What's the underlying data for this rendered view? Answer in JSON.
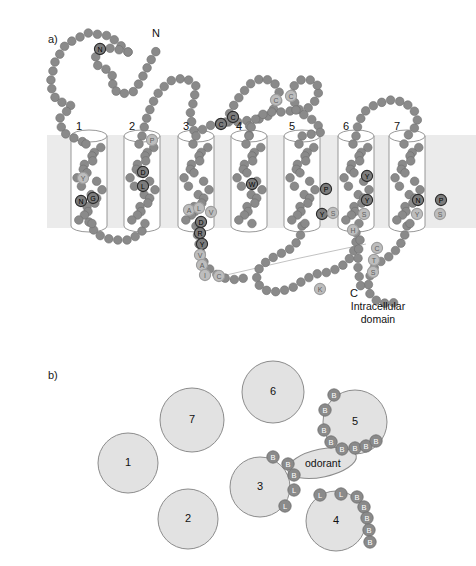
{
  "figure": {
    "type": "scientific-diagram",
    "panels": [
      {
        "id": "a",
        "label": "a)",
        "x": 48,
        "y": 33
      },
      {
        "id": "b",
        "label": "b)",
        "x": 48,
        "y": 369
      }
    ]
  },
  "panel_a": {
    "n_terminus_label": "N",
    "c_terminus_label": "C",
    "intracellular_caption_line1": "Intracellular",
    "intracellular_caption_line2": "domain",
    "membrane": {
      "top": 135,
      "bottom": 228,
      "color": "#ebebeb"
    },
    "helices": [
      {
        "num": "1",
        "label_x": 76,
        "label_y": 120,
        "cx": 89,
        "top": 136,
        "bottom": 226,
        "rx": 18
      },
      {
        "num": "2",
        "label_x": 129,
        "label_y": 120,
        "cx": 142,
        "top": 136,
        "bottom": 226,
        "rx": 18
      },
      {
        "num": "3",
        "label_x": 183,
        "label_y": 120,
        "cx": 196,
        "top": 136,
        "bottom": 226,
        "rx": 18
      },
      {
        "num": "4",
        "label_x": 236,
        "label_y": 120,
        "cx": 249,
        "top": 136,
        "bottom": 226,
        "rx": 18
      },
      {
        "num": "5",
        "label_x": 289,
        "label_y": 120,
        "cx": 302,
        "top": 136,
        "bottom": 226,
        "rx": 18
      },
      {
        "num": "6",
        "label_x": 343,
        "label_y": 120,
        "cx": 356,
        "top": 136,
        "bottom": 226,
        "rx": 18
      },
      {
        "num": "7",
        "label_x": 394,
        "label_y": 120,
        "cx": 407,
        "top": 136,
        "bottom": 226,
        "rx": 18
      }
    ],
    "residue_colors": {
      "dark_bead": "#8a8a8a",
      "bead_stroke": "#6e6e6e",
      "highlight_dark": "#7c7c7c",
      "highlight_light": "#bdbdbd",
      "label_dark": "#111111",
      "label_light": "#777777"
    },
    "labeled_residues": [
      {
        "letter": "N",
        "x": 100,
        "y": 49,
        "tone": "dark",
        "note": "glycosylation-site"
      },
      {
        "letter": "Y",
        "x": 83,
        "y": 178,
        "tone": "light"
      },
      {
        "letter": "N",
        "x": 81,
        "y": 201,
        "tone": "dark"
      },
      {
        "letter": "G",
        "x": 93,
        "y": 198,
        "tone": "dark"
      },
      {
        "letter": "P",
        "x": 152,
        "y": 140,
        "tone": "light"
      },
      {
        "letter": "D",
        "x": 143,
        "y": 172,
        "tone": "dark"
      },
      {
        "letter": "L",
        "x": 143,
        "y": 186,
        "tone": "dark"
      },
      {
        "letter": "C",
        "x": 221,
        "y": 124,
        "tone": "dark",
        "note": "disulfide"
      },
      {
        "letter": "C",
        "x": 233,
        "y": 117,
        "tone": "dark",
        "note": "disulfide"
      },
      {
        "letter": "C",
        "x": 276,
        "y": 100,
        "tone": "light"
      },
      {
        "letter": "C",
        "x": 291,
        "y": 96,
        "tone": "light"
      },
      {
        "letter": "A",
        "x": 189,
        "y": 210,
        "tone": "light"
      },
      {
        "letter": "L",
        "x": 199,
        "y": 208,
        "tone": "light"
      },
      {
        "letter": "V",
        "x": 211,
        "y": 212,
        "tone": "light"
      },
      {
        "letter": "D",
        "x": 201,
        "y": 222,
        "tone": "dark"
      },
      {
        "letter": "R",
        "x": 200,
        "y": 233,
        "tone": "dark"
      },
      {
        "letter": "Y",
        "x": 202,
        "y": 244,
        "tone": "dark"
      },
      {
        "letter": "V",
        "x": 200,
        "y": 255,
        "tone": "light"
      },
      {
        "letter": "A",
        "x": 202,
        "y": 265,
        "tone": "light"
      },
      {
        "letter": "I",
        "x": 205,
        "y": 275,
        "tone": "light"
      },
      {
        "letter": "C",
        "x": 219,
        "y": 276,
        "tone": "light"
      },
      {
        "letter": "W",
        "x": 252,
        "y": 184,
        "tone": "dark"
      },
      {
        "letter": "P",
        "x": 326,
        "y": 189,
        "tone": "dark"
      },
      {
        "letter": "Y",
        "x": 322,
        "y": 214,
        "tone": "dark"
      },
      {
        "letter": "S",
        "x": 333,
        "y": 213,
        "tone": "light"
      },
      {
        "letter": "Y",
        "x": 367,
        "y": 176,
        "tone": "dark"
      },
      {
        "letter": "Y",
        "x": 367,
        "y": 200,
        "tone": "dark"
      },
      {
        "letter": "S",
        "x": 364,
        "y": 214,
        "tone": "light"
      },
      {
        "letter": "H",
        "x": 353,
        "y": 230,
        "tone": "light"
      },
      {
        "letter": "N",
        "x": 418,
        "y": 200,
        "tone": "dark"
      },
      {
        "letter": "P",
        "x": 441,
        "y": 200,
        "tone": "dark"
      },
      {
        "letter": "Y",
        "x": 417,
        "y": 214,
        "tone": "light"
      },
      {
        "letter": "S",
        "x": 440,
        "y": 214,
        "tone": "light"
      },
      {
        "letter": "C",
        "x": 377,
        "y": 248,
        "tone": "light"
      },
      {
        "letter": "T",
        "x": 374,
        "y": 260,
        "tone": "light"
      },
      {
        "letter": "S",
        "x": 373,
        "y": 272,
        "tone": "light"
      },
      {
        "letter": "K",
        "x": 320,
        "y": 289,
        "tone": "light"
      }
    ]
  },
  "panel_b": {
    "odorant_label": "odorant",
    "circles": [
      {
        "num": "1",
        "cx": 128,
        "cy": 463,
        "r": 30
      },
      {
        "num": "2",
        "cx": 188,
        "cy": 519,
        "r": 30
      },
      {
        "num": "3",
        "cx": 260,
        "cy": 487,
        "r": 30
      },
      {
        "num": "4",
        "cx": 336,
        "cy": 521,
        "r": 30
      },
      {
        "num": "5",
        "cx": 355,
        "cy": 422,
        "r": 32
      },
      {
        "num": "6",
        "cx": 273,
        "cy": 392,
        "r": 31
      },
      {
        "num": "7",
        "cx": 192,
        "cy": 420,
        "r": 32
      }
    ],
    "odorant_ellipse": {
      "cx": 322,
      "cy": 463,
      "rx": 35,
      "ry": 14,
      "rotate": -12
    },
    "binding_residues": [
      {
        "letter": "B",
        "x": 273,
        "y": 457,
        "helix": "3"
      },
      {
        "letter": "B",
        "x": 288,
        "y": 464,
        "helix": "3"
      },
      {
        "letter": "B",
        "x": 294,
        "y": 475,
        "helix": "3"
      },
      {
        "letter": "L",
        "x": 294,
        "y": 490,
        "helix": "3"
      },
      {
        "letter": "L",
        "x": 285,
        "y": 506,
        "helix": "3"
      },
      {
        "letter": "L",
        "x": 320,
        "y": 495,
        "helix": "4"
      },
      {
        "letter": "L",
        "x": 341,
        "y": 494,
        "helix": "4"
      },
      {
        "letter": "B",
        "x": 357,
        "y": 497,
        "helix": "4"
      },
      {
        "letter": "B",
        "x": 364,
        "y": 507,
        "helix": "4"
      },
      {
        "letter": "B",
        "x": 367,
        "y": 518,
        "helix": "4"
      },
      {
        "letter": "B",
        "x": 369,
        "y": 530,
        "helix": "4"
      },
      {
        "letter": "B",
        "x": 370,
        "y": 542,
        "helix": "4"
      },
      {
        "letter": "B",
        "x": 334,
        "y": 395,
        "helix": "5"
      },
      {
        "letter": "B",
        "x": 325,
        "y": 410,
        "helix": "5"
      },
      {
        "letter": "B",
        "x": 324,
        "y": 430,
        "helix": "5"
      },
      {
        "letter": "B",
        "x": 331,
        "y": 442,
        "helix": "5"
      },
      {
        "letter": "B",
        "x": 342,
        "y": 449,
        "helix": "5"
      },
      {
        "letter": "B",
        "x": 355,
        "y": 448,
        "helix": "5"
      },
      {
        "letter": "B",
        "x": 366,
        "y": 446,
        "helix": "5"
      },
      {
        "letter": "B",
        "x": 376,
        "y": 441,
        "helix": "5"
      }
    ],
    "circle_fill": "#e2e2e2",
    "circle_stroke": "#8c8c8c",
    "bead_fill": "#8a8a8a"
  }
}
